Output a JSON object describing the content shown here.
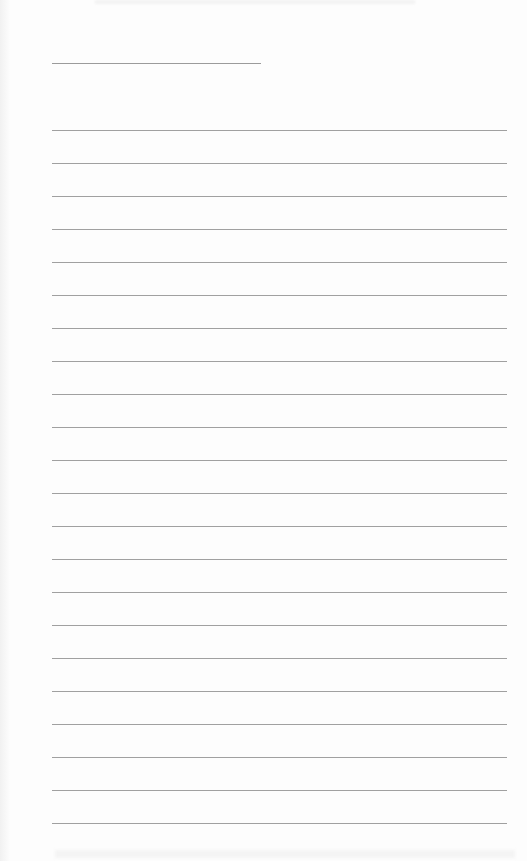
{
  "document": {
    "type": "lined-writing-page",
    "header_line": {
      "x": 52,
      "y": 63,
      "width": 209
    },
    "ruled_lines": {
      "count": 22,
      "start_y": 130,
      "spacing": 33,
      "x": 52,
      "width": 455
    },
    "line_color": "#a0a0a0",
    "background_color": "#fdfdfd",
    "text_content": []
  }
}
